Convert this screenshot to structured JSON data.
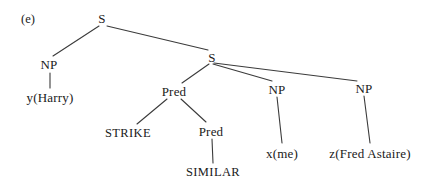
{
  "figure": {
    "label": "(e)",
    "label_x": 28,
    "label_y": 19,
    "width": 429,
    "height": 190,
    "background": "#ffffff",
    "ink_color": "#1a1a1a",
    "line_color": "#3b3b3b"
  },
  "tree": {
    "type": "syntax-tree",
    "nodes": [
      {
        "id": "s_root",
        "label": "S",
        "kind": "category",
        "x": 102,
        "y": 18
      },
      {
        "id": "np_left",
        "label": "NP",
        "kind": "category",
        "x": 49,
        "y": 64
      },
      {
        "id": "y_harry",
        "label": "y(Harry)",
        "kind": "leaf",
        "x": 50,
        "y": 97
      },
      {
        "id": "s_inner",
        "label": "S",
        "kind": "category",
        "x": 212,
        "y": 57
      },
      {
        "id": "pred_1",
        "label": "Pred",
        "kind": "category",
        "x": 174,
        "y": 91
      },
      {
        "id": "strike",
        "label": "STRIKE",
        "kind": "terminal",
        "x": 128,
        "y": 133
      },
      {
        "id": "pred_2",
        "label": "Pred",
        "kind": "category",
        "x": 211,
        "y": 131
      },
      {
        "id": "similar",
        "label": "SIMILAR",
        "kind": "terminal",
        "x": 213,
        "y": 172
      },
      {
        "id": "np_mid",
        "label": "NP",
        "kind": "category",
        "x": 277,
        "y": 89
      },
      {
        "id": "x_me",
        "label": "x(me)",
        "kind": "leaf",
        "x": 282,
        "y": 153
      },
      {
        "id": "np_right",
        "label": "NP",
        "kind": "category",
        "x": 364,
        "y": 88
      },
      {
        "id": "z_fred",
        "label": "z(Fred Astaire)",
        "kind": "leaf",
        "x": 370,
        "y": 153
      }
    ],
    "edges": [
      {
        "from": "s_root",
        "to": "np_left",
        "x1": 99,
        "y1": 26,
        "x2": 53,
        "y2": 56
      },
      {
        "from": "s_root",
        "to": "s_inner",
        "x1": 107,
        "y1": 26,
        "x2": 208,
        "y2": 50
      },
      {
        "from": "np_left",
        "to": "y_harry",
        "x1": 50,
        "y1": 73,
        "x2": 50,
        "y2": 88
      },
      {
        "from": "s_inner",
        "to": "pred_1",
        "x1": 209,
        "y1": 64,
        "x2": 182,
        "y2": 83
      },
      {
        "from": "s_inner",
        "to": "np_mid",
        "x1": 213,
        "y1": 64,
        "x2": 272,
        "y2": 81
      },
      {
        "from": "s_inner",
        "to": "np_right",
        "x1": 214,
        "y1": 63,
        "x2": 357,
        "y2": 81
      },
      {
        "from": "pred_1",
        "to": "strike",
        "x1": 167,
        "y1": 99,
        "x2": 137,
        "y2": 124
      },
      {
        "from": "pred_1",
        "to": "pred_2",
        "x1": 181,
        "y1": 99,
        "x2": 206,
        "y2": 122
      },
      {
        "from": "pred_2",
        "to": "similar",
        "x1": 212,
        "y1": 139,
        "x2": 213,
        "y2": 163
      },
      {
        "from": "np_mid",
        "to": "x_me",
        "x1": 277,
        "y1": 97,
        "x2": 282,
        "y2": 143
      },
      {
        "from": "np_right",
        "to": "z_fred",
        "x1": 364,
        "y1": 96,
        "x2": 370,
        "y2": 143
      }
    ]
  }
}
